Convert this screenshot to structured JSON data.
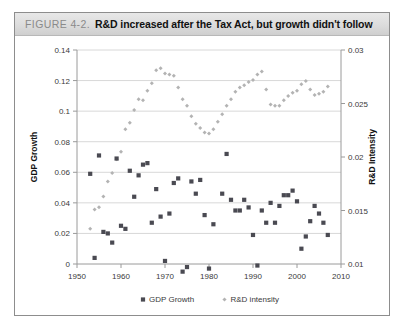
{
  "figure": {
    "number": "FIGURE 4-2.",
    "title": "R&D increased after the Tax Act, but growth didn't follow"
  },
  "colors": {
    "gdp_marker": "#4a4a52",
    "rd_marker": "#b3b3b3",
    "gridline": "#d8d8d8",
    "axis": "#9a9a9a",
    "header_bg": "#dcdcdc"
  },
  "chart_data": {
    "type": "scatter",
    "title": "R&D increased after the Tax Act, but growth didn't follow",
    "xlabel": "",
    "xlim": [
      1950,
      2010
    ],
    "xticks": [
      1950,
      1960,
      1970,
      1980,
      1990,
      2000,
      2010
    ],
    "grid": "horizontal",
    "legend_position": "bottom",
    "axes": [
      {
        "side": "left",
        "label": "GDP Growth",
        "lim": [
          0,
          0.14
        ],
        "ticks": [
          0,
          0.02,
          0.04,
          0.06,
          0.08,
          0.1,
          0.12,
          0.14
        ],
        "ticklabels": [
          "0",
          "0.02",
          "0.04",
          "0.06",
          "0.08",
          "0.1",
          "0.12",
          "0.14"
        ]
      },
      {
        "side": "right",
        "label": "R&D Intensity",
        "lim": [
          0.01,
          0.03
        ],
        "ticks": [
          0.01,
          0.015,
          0.02,
          0.025,
          0.03
        ],
        "ticklabels": [
          "0.01",
          "0.015",
          "0.02",
          "0.025",
          "0.03"
        ]
      }
    ],
    "series": [
      {
        "name": "GDP Growth",
        "marker": "square",
        "color": "#4a4a52",
        "axis": "left",
        "points": [
          [
            1953,
            0.059
          ],
          [
            1954,
            0.004
          ],
          [
            1955,
            0.071
          ],
          [
            1956,
            0.021
          ],
          [
            1957,
            0.02
          ],
          [
            1958,
            0.014
          ],
          [
            1959,
            0.069
          ],
          [
            1960,
            0.025
          ],
          [
            1961,
            0.023
          ],
          [
            1962,
            0.061
          ],
          [
            1963,
            0.044
          ],
          [
            1964,
            0.058
          ],
          [
            1965,
            0.065
          ],
          [
            1966,
            0.066
          ],
          [
            1967,
            0.027
          ],
          [
            1968,
            0.049
          ],
          [
            1969,
            0.031
          ],
          [
            1970,
            0.002
          ],
          [
            1971,
            0.033
          ],
          [
            1972,
            0.053
          ],
          [
            1973,
            0.056
          ],
          [
            1974,
            -0.005
          ],
          [
            1975,
            -0.002
          ],
          [
            1976,
            0.054
          ],
          [
            1977,
            0.046
          ],
          [
            1978,
            0.055
          ],
          [
            1979,
            0.032
          ],
          [
            1980,
            -0.003
          ],
          [
            1981,
            0.026
          ],
          [
            1982,
            -0.019
          ],
          [
            1983,
            0.046
          ],
          [
            1984,
            0.072
          ],
          [
            1985,
            0.042
          ],
          [
            1986,
            0.035
          ],
          [
            1987,
            0.035
          ],
          [
            1988,
            0.042
          ],
          [
            1989,
            0.037
          ],
          [
            1990,
            0.019
          ],
          [
            1991,
            -0.001
          ],
          [
            1992,
            0.035
          ],
          [
            1993,
            0.027
          ],
          [
            1994,
            0.04
          ],
          [
            1995,
            0.027
          ],
          [
            1996,
            0.038
          ],
          [
            1997,
            0.045
          ],
          [
            1998,
            0.045
          ],
          [
            1999,
            0.048
          ],
          [
            2000,
            0.041
          ],
          [
            2001,
            0.01
          ],
          [
            2002,
            0.018
          ],
          [
            2003,
            0.028
          ],
          [
            2004,
            0.038
          ],
          [
            2005,
            0.033
          ],
          [
            2006,
            0.027
          ],
          [
            2007,
            0.019
          ]
        ]
      },
      {
        "name": "R&D intensity",
        "marker": "diamond",
        "color": "#b3b3b3",
        "axis": "right",
        "points": [
          [
            1953,
            0.0133
          ],
          [
            1954,
            0.0151
          ],
          [
            1955,
            0.0153
          ],
          [
            1956,
            0.0163
          ],
          [
            1957,
            0.0177
          ],
          [
            1958,
            0.0185
          ],
          [
            1959,
            0.0198
          ],
          [
            1960,
            0.0205
          ],
          [
            1961,
            0.0226
          ],
          [
            1962,
            0.0232
          ],
          [
            1963,
            0.0244
          ],
          [
            1964,
            0.0254
          ],
          [
            1965,
            0.0253
          ],
          [
            1966,
            0.0262
          ],
          [
            1967,
            0.0269
          ],
          [
            1968,
            0.0281
          ],
          [
            1969,
            0.0283
          ],
          [
            1970,
            0.0278
          ],
          [
            1971,
            0.0277
          ],
          [
            1972,
            0.0276
          ],
          [
            1973,
            0.0265
          ],
          [
            1974,
            0.0254
          ],
          [
            1975,
            0.0248
          ],
          [
            1976,
            0.0238
          ],
          [
            1977,
            0.0231
          ],
          [
            1978,
            0.0227
          ],
          [
            1979,
            0.0223
          ],
          [
            1980,
            0.0222
          ],
          [
            1981,
            0.0226
          ],
          [
            1982,
            0.0233
          ],
          [
            1983,
            0.024
          ],
          [
            1984,
            0.0248
          ],
          [
            1985,
            0.0254
          ],
          [
            1986,
            0.0261
          ],
          [
            1987,
            0.0265
          ],
          [
            1988,
            0.0267
          ],
          [
            1989,
            0.027
          ],
          [
            1990,
            0.0272
          ],
          [
            1991,
            0.0277
          ],
          [
            1992,
            0.028
          ],
          [
            1993,
            0.0263
          ],
          [
            1994,
            0.0249
          ],
          [
            1995,
            0.0248
          ],
          [
            1996,
            0.0248
          ],
          [
            1997,
            0.0253
          ],
          [
            1998,
            0.0257
          ],
          [
            1999,
            0.026
          ],
          [
            2000,
            0.0262
          ],
          [
            2001,
            0.0268
          ],
          [
            2002,
            0.0271
          ],
          [
            2003,
            0.0263
          ],
          [
            2004,
            0.0258
          ],
          [
            2005,
            0.0259
          ],
          [
            2006,
            0.0261
          ],
          [
            2007,
            0.0266
          ]
        ]
      }
    ],
    "legend": [
      {
        "label": "GDP Growth",
        "marker": "square",
        "color": "#4a4a52"
      },
      {
        "label": "R&D intensity",
        "marker": "diamond",
        "color": "#b3b3b3"
      }
    ]
  }
}
